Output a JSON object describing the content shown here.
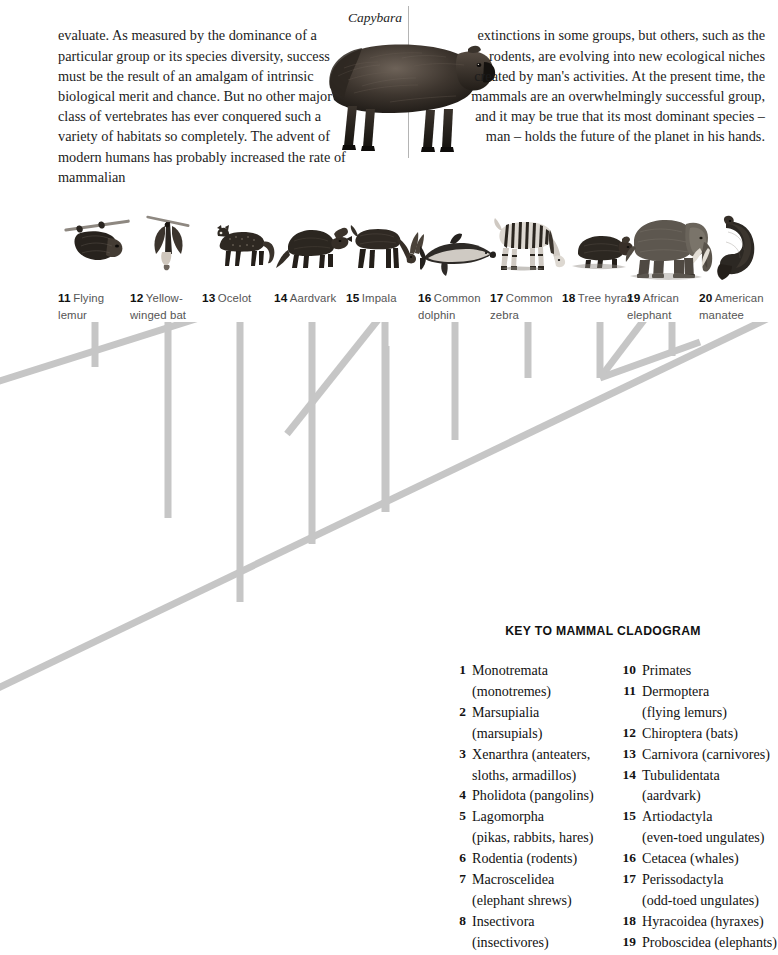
{
  "article": {
    "left_column_text": "evaluate. As measured by the dominance of a particular group or its species diversity, success must be the result of an amalgam of intrinsic biological merit and chance. But no other major class of vertebrates has ever conquered such a variety of habitats so completely. The advent of modern humans has probably increased the rate of mammalian",
    "right_column_text": "extinctions in some groups, but others, such as the rodents, are evolving into new ecological niches created by man's activities. At the present time, the mammals are an overwhelmingly successful group, and it may be true that its most dominant species – man – holds the future of the planet in his hands.",
    "figure_caption": "Capybara"
  },
  "animals": [
    {
      "number": "11",
      "name": "Flying lemur",
      "icon": "sloth-icon"
    },
    {
      "number": "12",
      "name": "Yellow-winged bat",
      "icon": "bat-icon"
    },
    {
      "number": "13",
      "name": "Ocelot",
      "icon": "ocelot-icon"
    },
    {
      "number": "14",
      "name": "Aardvark",
      "icon": "aardvark-icon"
    },
    {
      "number": "15",
      "name": "Impala",
      "icon": "impala-icon"
    },
    {
      "number": "16",
      "name": "Common dolphin",
      "icon": "dolphin-icon"
    },
    {
      "number": "17",
      "name": "Common zebra",
      "icon": "zebra-icon"
    },
    {
      "number": "18",
      "name": "Tree hyrax",
      "icon": "hyrax-icon"
    },
    {
      "number": "19",
      "name": "African elephant",
      "icon": "elephant-icon"
    },
    {
      "number": "20",
      "name": "American manatee",
      "icon": "manatee-icon"
    }
  ],
  "key": {
    "title": "KEY TO MAMMAL CLADOGRAM",
    "left_entries": [
      {
        "num": "1",
        "name": "Monotremata",
        "sub": "(monotremes)"
      },
      {
        "num": "2",
        "name": "Marsupialia",
        "sub": "(marsupials)"
      },
      {
        "num": "3",
        "name": "Xenarthra (anteaters,",
        "sub": "sloths, armadillos)"
      },
      {
        "num": "4",
        "name": "Pholidota (pangolins)",
        "sub": ""
      },
      {
        "num": "5",
        "name": "Lagomorpha",
        "sub": "(pikas, rabbits, hares)"
      },
      {
        "num": "6",
        "name": "Rodentia (rodents)",
        "sub": ""
      },
      {
        "num": "7",
        "name": "Macroscelidea",
        "sub": "(elephant shrews)"
      },
      {
        "num": "8",
        "name": "Insectivora",
        "sub": "(insectivores)"
      }
    ],
    "right_entries": [
      {
        "num": "10",
        "name": "Primates",
        "sub": ""
      },
      {
        "num": "11",
        "name": "Dermoptera",
        "sub": "(flying lemurs)"
      },
      {
        "num": "12",
        "name": "Chiroptera (bats)",
        "sub": ""
      },
      {
        "num": "13",
        "name": "Carnivora (carnivores)",
        "sub": ""
      },
      {
        "num": "14",
        "name": "Tubulidentata",
        "sub": "(aardvark)"
      },
      {
        "num": "15",
        "name": "Artiodactyla",
        "sub": "(even-toed ungulates)"
      },
      {
        "num": "16",
        "name": "Cetacea (whales)",
        "sub": ""
      },
      {
        "num": "17",
        "name": "Perissodactyla",
        "sub": "(odd-toed ungulates)"
      },
      {
        "num": "18",
        "name": "Hyracoidea (hyraxes)",
        "sub": ""
      },
      {
        "num": "19",
        "name": "Proboscidea (elephants)",
        "sub": ""
      }
    ]
  },
  "colors": {
    "cladogram_line": "#c6c6c6",
    "divider": "#b4b4b4",
    "label_text": "#555555",
    "body_text": "#1c1c1c"
  }
}
